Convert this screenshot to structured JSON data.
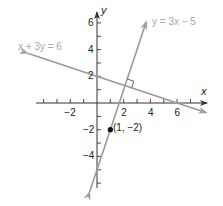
{
  "figure": {
    "type": "coordinate-graph",
    "axes": {
      "x_label": "x",
      "y_label": "y",
      "x_ticks": [
        -4,
        -3,
        -2,
        -1,
        1,
        2,
        3,
        4,
        5,
        6,
        7
      ],
      "x_tick_labels": [
        {
          "value": -2,
          "text": "−2"
        },
        {
          "value": 2,
          "text": "2"
        },
        {
          "value": 4,
          "text": "4"
        },
        {
          "value": 6,
          "text": "6"
        }
      ],
      "y_ticks": [
        -6,
        -5,
        -4,
        -3,
        -2,
        -1,
        1,
        2,
        3,
        4,
        5,
        6
      ],
      "y_tick_labels": [
        {
          "value": 6,
          "text": "6"
        },
        {
          "value": 4,
          "text": "4"
        },
        {
          "value": 2,
          "text": "2"
        },
        {
          "value": -2,
          "text": "−2"
        },
        {
          "value": -4,
          "text": "−4"
        }
      ],
      "xlim": [
        -4.8,
        8.5
      ],
      "ylim": [
        -6.9,
        6.8
      ]
    },
    "lines": [
      {
        "name": "line-y-3x-5",
        "equation": "y = 3x − 5",
        "color": "#9a9a9a",
        "from": [
          -0.55,
          -6.65
        ],
        "to": [
          3.7,
          6.1
        ]
      },
      {
        "name": "line-x-3y-6",
        "equation": "x + 3y = 6",
        "color": "#9a9a9a",
        "from": [
          -5.2,
          3.73
        ],
        "to": [
          8.2,
          -0.73
        ]
      }
    ],
    "point": {
      "label": "(1, −2)",
      "x": 1,
      "y": -2,
      "color": "#111111"
    },
    "right_angle_marker": {
      "at": [
        1.8,
        1.4
      ]
    },
    "labels": {
      "eq1": "y = 3x − 5",
      "eq2": "x + 3y = 6",
      "point": "(1, −2)",
      "x_axis": "x",
      "y_axis": "y"
    }
  },
  "colors": {
    "axis": "#333333",
    "line": "#a0a0a0",
    "label_gray": "#a8a8a8",
    "point": "#111111"
  }
}
